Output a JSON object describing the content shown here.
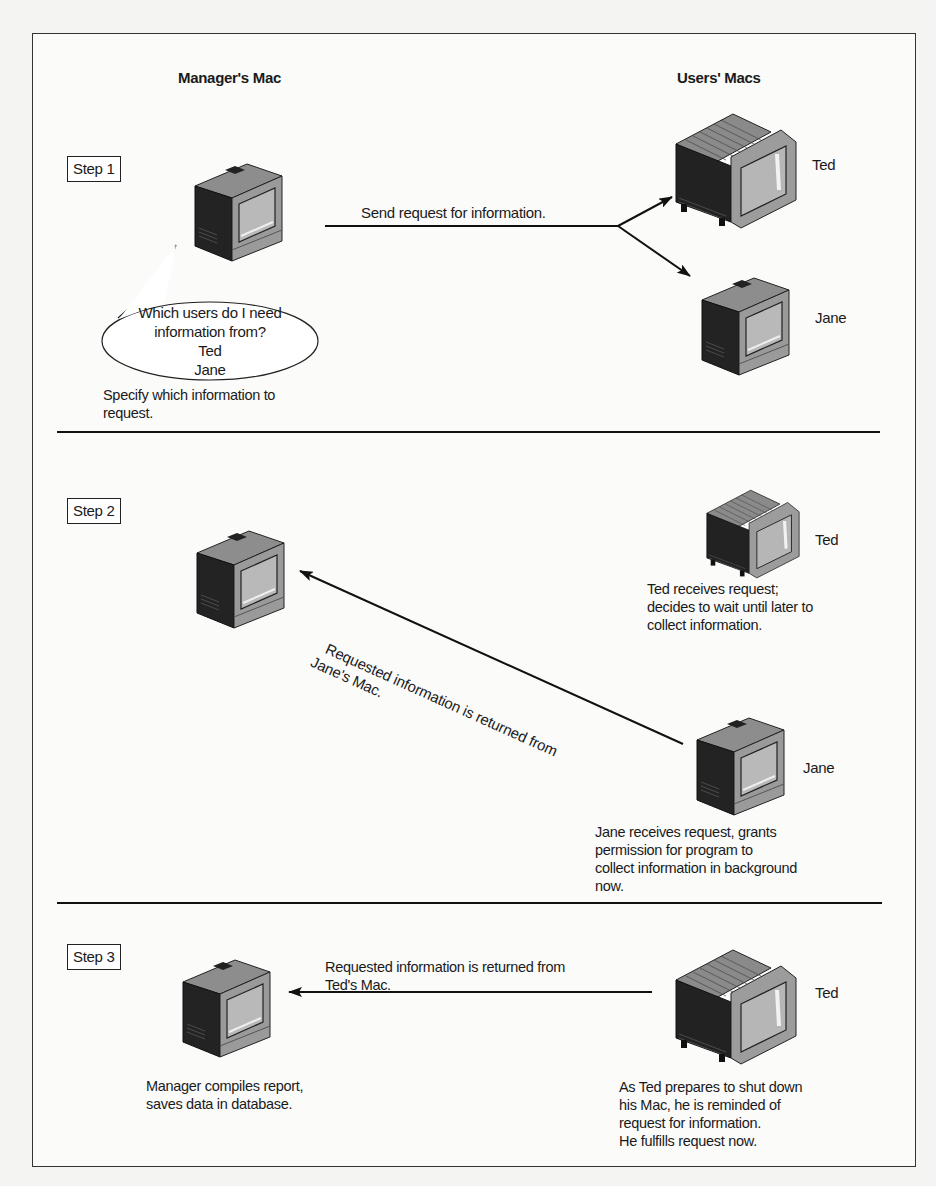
{
  "headers": {
    "manager": "Manager's Mac",
    "users": "Users' Macs"
  },
  "steps": [
    {
      "label": "Step 1",
      "arrow_label": "Send request for information.",
      "bubble": [
        "Which users do I need",
        "information from?",
        "Ted",
        "Jane"
      ],
      "manager_caption": "Specify which information to\nrequest.",
      "users": [
        {
          "name": "Ted",
          "model": "large-monitor"
        },
        {
          "name": "Jane",
          "model": "compact-mac"
        }
      ]
    },
    {
      "label": "Step 2",
      "arrow_label_line1": "Requested information is returned from",
      "arrow_label_line2": "Jane's Mac.",
      "users": [
        {
          "name": "Ted",
          "caption": "Ted receives request;\ndecides to wait until later to\ncollect information."
        },
        {
          "name": "Jane",
          "caption": "Jane receives request, grants\npermission for program to\ncollect information in background\nnow."
        }
      ]
    },
    {
      "label": "Step 3",
      "arrow_label": "Requested information is returned from\nTed's Mac.",
      "manager_caption": "Manager compiles report,\nsaves data in database.",
      "users": [
        {
          "name": "Ted",
          "caption": "As Ted prepares to shut down\nhis Mac, he is reminded of\nrequest for information.\nHe fulfills request now."
        }
      ]
    }
  ],
  "colors": {
    "ink": "#1a1a1a",
    "paper": "#fbfbfa",
    "mac_dark": "#2a2a2a",
    "mac_light": "#9a9a9a",
    "mac_screen": "#b8b8b8"
  }
}
